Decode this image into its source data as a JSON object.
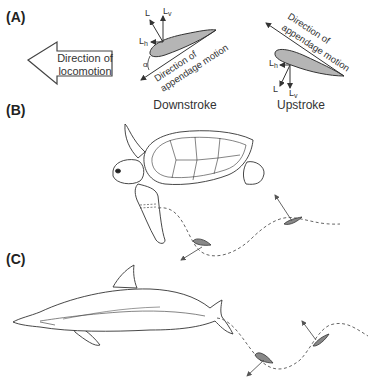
{
  "panels": {
    "a": {
      "label": "(A)",
      "locomotion_arrow_text": [
        "Direction of",
        "locomotion"
      ],
      "downstroke": {
        "caption": "Downstroke",
        "motion_text": [
          "Direction of",
          "appendage motion"
        ],
        "force_labels": {
          "lift": "L",
          "vertical": "L",
          "vertical_sub": "v",
          "horizontal": "L",
          "horizontal_sub": "h",
          "angle": "α"
        }
      },
      "upstroke": {
        "caption": "Upstroke",
        "motion_text": [
          "Direction of",
          "appendage motion"
        ],
        "force_labels": {
          "lift": "L",
          "vertical": "L",
          "vertical_sub": "v",
          "horizontal": "L",
          "horizontal_sub": "h"
        }
      }
    },
    "b": {
      "label": "(B)",
      "animal": "sea turtle"
    },
    "c": {
      "label": "(C)",
      "animal": "dolphin"
    }
  },
  "colors": {
    "line": "#333333",
    "foil_fill": "#b5b5b5",
    "background": "#ffffff"
  }
}
